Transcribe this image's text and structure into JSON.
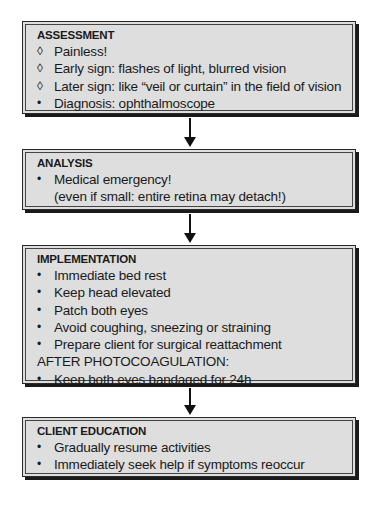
{
  "boxes": [
    {
      "title": "ASSESSMENT",
      "items": [
        {
          "marker": "◊",
          "text": "Painless!"
        },
        {
          "marker": "◊",
          "text": "Early sign: flashes of light, blurred vision"
        },
        {
          "marker": "◊",
          "text": "Later sign: like “veil or curtain” in the field of vision"
        },
        {
          "marker": "•",
          "text": "Diagnosis: ophthalmoscope"
        }
      ]
    },
    {
      "title": "ANALYSIS",
      "items": [
        {
          "marker": "•",
          "text": "Medical emergency!"
        }
      ],
      "continuation": "(even if small: entire retina may detach!)"
    },
    {
      "title": "IMPLEMENTATION",
      "items": [
        {
          "marker": "•",
          "text": "Immediate bed rest"
        },
        {
          "marker": "•",
          "text": "Keep head elevated"
        },
        {
          "marker": "•",
          "text": "Patch both eyes"
        },
        {
          "marker": "•",
          "text": "Avoid coughing, sneezing or straining"
        },
        {
          "marker": "•",
          "text": "Prepare client for surgical reattachment"
        }
      ],
      "subheading": "AFTER PHOTOCOAGULATION:",
      "sub_items": [
        {
          "marker": "•",
          "text": "Keep both eyes bandaged for 24h"
        }
      ]
    },
    {
      "title": "CLIENT EDUCATION",
      "items": [
        {
          "marker": "•",
          "text": "Gradually resume activities"
        },
        {
          "marker": "•",
          "text": "Immediately seek help if symptoms reoccur"
        }
      ]
    }
  ]
}
